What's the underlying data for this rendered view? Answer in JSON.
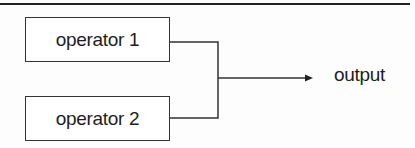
{
  "diagram": {
    "nodes": [
      {
        "id": "op1",
        "label": "operator 1"
      },
      {
        "id": "op2",
        "label": "operator 2"
      }
    ],
    "output": {
      "label": "output"
    },
    "edges": [
      {
        "from": "op1",
        "to": "output"
      },
      {
        "from": "op2",
        "to": "output"
      }
    ],
    "line_color": "#333333"
  }
}
